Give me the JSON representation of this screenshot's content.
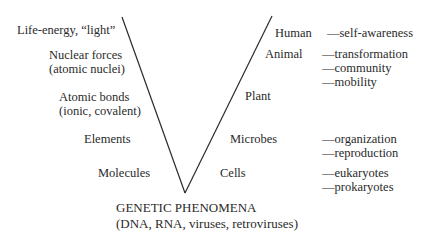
{
  "diagram": {
    "type": "v-diagram",
    "line_color": "#2a2a2a",
    "left_arm": {
      "labels": [
        {
          "text": "Life-energy, “light”"
        },
        {
          "text": "Nuclear forces"
        },
        {
          "text": "(atomic nuclei)"
        },
        {
          "text": "Atomic bonds"
        },
        {
          "text": "(ionic, covalent)"
        },
        {
          "text": "Elements"
        },
        {
          "text": "Molecules"
        }
      ]
    },
    "right_arm": {
      "labels": [
        {
          "text": "Human"
        },
        {
          "text": "Animal"
        },
        {
          "text": "Plant"
        },
        {
          "text": "Microbes"
        },
        {
          "text": "Cells"
        }
      ],
      "traits": [
        {
          "text": "—self-awareness"
        },
        {
          "text": "—transformation"
        },
        {
          "text": "—community"
        },
        {
          "text": "—mobility"
        },
        {
          "text": "—organization"
        },
        {
          "text": "—reproduction"
        },
        {
          "text": "—eukaryotes"
        },
        {
          "text": "—prokaryotes"
        }
      ]
    },
    "base": {
      "title": "GENETIC PHENOMENA",
      "subtitle": "(DNA, RNA, viruses, retroviruses)"
    }
  }
}
